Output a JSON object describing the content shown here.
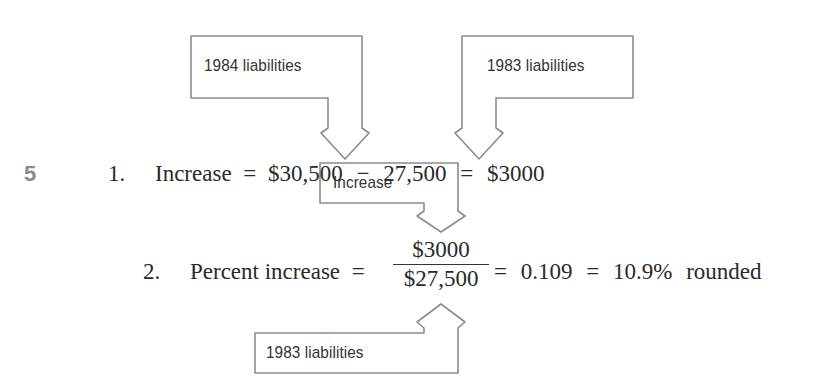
{
  "step_marker": "5",
  "callouts": {
    "top_left": {
      "label": "1984 liabilities",
      "points_to": "$30,500"
    },
    "top_right": {
      "label": "1983 liabilities",
      "points_to": "27,500"
    },
    "middle": {
      "label": "Increase",
      "points_to": "$3000"
    },
    "bottom": {
      "label": "1983 liabilities",
      "points_to": "$27,500"
    }
  },
  "line1": {
    "number": "1.",
    "lhs": "Increase",
    "eq1": "=",
    "a": "$30,500",
    "minus": "−",
    "b": "27,500",
    "eq2": "=",
    "result": "$3000"
  },
  "line2": {
    "number": "2.",
    "lhs": "Percent increase",
    "eq1": "=",
    "numerator": "$3000",
    "denominator": "$27,500",
    "eq2": "=",
    "decimal": "0.109",
    "eq3": "=",
    "percent": "10.9%",
    "note": "rounded"
  },
  "colors": {
    "callout_stroke": "#8c8c8c",
    "text": "#2a2a2a",
    "step_marker": "#8a8a8a"
  }
}
